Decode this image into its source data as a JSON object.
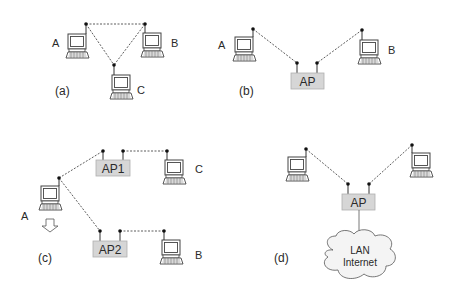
{
  "colors": {
    "line": "#333333",
    "ap_fill": "#d6d6d6",
    "ap_stroke": "#a9a9a9",
    "cloud_fill": "#f2f2f2",
    "cloud_stroke": "#555555",
    "computer_stroke": "#444444",
    "background": "#ffffff"
  },
  "panels": {
    "a": {
      "caption": "(a)",
      "nodes": {
        "A": "A",
        "B": "B",
        "C": "C"
      },
      "topology": "ad-hoc triangle between A, B, C"
    },
    "b": {
      "caption": "(b)",
      "nodes": {
        "A": "A",
        "B": "B"
      },
      "ap": "AP",
      "topology": "A and B connected via single access point"
    },
    "c": {
      "caption": "(c)",
      "nodes": {
        "A": "A",
        "B": "B",
        "C": "C"
      },
      "ap1": "AP1",
      "ap2": "AP2",
      "topology": "A roams between AP1 (with C) and AP2 (with B); downward arrow under A"
    },
    "d": {
      "caption": "(d)",
      "ap": "AP",
      "cloud_line1": "LAN",
      "cloud_line2": "Internet",
      "topology": "two computers connected to AP, AP wired to LAN/Internet cloud"
    }
  }
}
